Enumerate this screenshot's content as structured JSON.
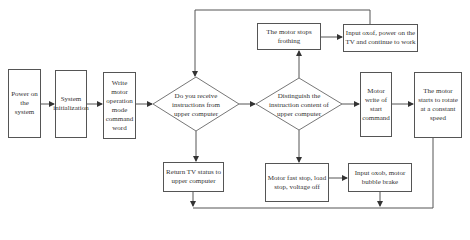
{
  "flowchart": {
    "nodes": {
      "power_on": "Power on the system",
      "system_init": "System initialization",
      "write_mode": "Write motor operation mode command word",
      "receive_decision": "Do you receive instructions from upper computer",
      "distinguish_decision": "Distinguish the instruction content of upper computer",
      "motor_write_start": "Motor write of start command",
      "constant_speed": "The motor starts to rotate at a constant speed",
      "stops_frothing": "The motor stops frothing",
      "input_oxof": "Input oxof, power on the TV and continue to work",
      "return_status": "Return TV status to upper computer",
      "fast_stop": "Motor fast stop, load stop, voltage off",
      "input_oxob": "Input oxob, motor bubble brake"
    },
    "colors": {
      "line": "#555555",
      "background": "#ffffff"
    }
  }
}
